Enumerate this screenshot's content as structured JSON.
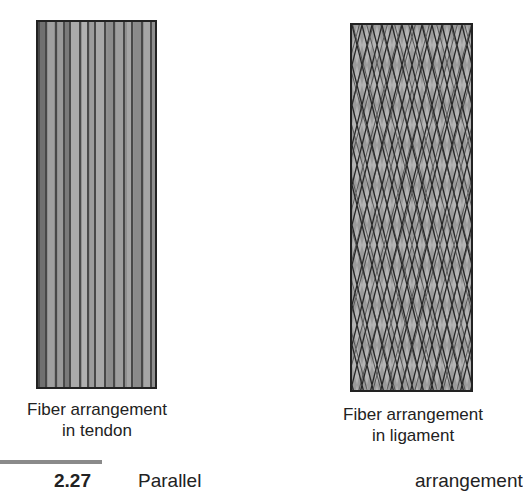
{
  "figure": {
    "panels": [
      {
        "id": "tendon",
        "caption_line1": "Fiber arrangement",
        "caption_line2": "in tendon",
        "pattern": "parallel-vertical-fibers"
      },
      {
        "id": "ligament",
        "caption_line1": "Fiber arrangement",
        "caption_line2": "in ligament",
        "pattern": "crisscross-interwoven-fibers"
      }
    ],
    "figure_number": "2.27",
    "caption_start": "Parallel",
    "caption_continued": "arrangement"
  }
}
